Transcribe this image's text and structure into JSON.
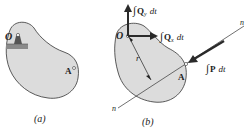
{
  "figure": {
    "panel_a": {
      "caption": "(a)",
      "point_O": "O",
      "point_A": "A"
    },
    "panel_b": {
      "caption": "(b)",
      "point_O": "O",
      "point_A": "A",
      "radius_label": "r",
      "line_label_top": "n",
      "line_label_bottom": "n",
      "impulse_Qy": {
        "integral": "∫",
        "symbol": "Q",
        "subscript": "y",
        "dt": "dt"
      },
      "impulse_Qx": {
        "integral": "∫",
        "symbol": "Q",
        "subscript": "x",
        "dt": "dt"
      },
      "impulse_P": {
        "integral": "∫",
        "symbol": "P",
        "dt": "dt"
      }
    },
    "colors": {
      "body_fill": "#dcdcdc",
      "outline": "#333333",
      "arrow": "#2a2a2a",
      "support": "#8a8a8a"
    }
  }
}
